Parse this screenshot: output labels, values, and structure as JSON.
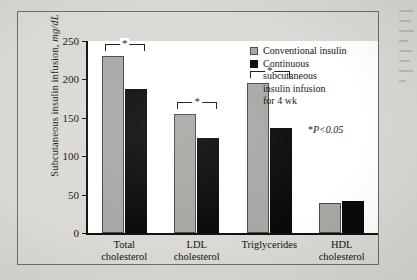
{
  "figure": {
    "y_axis_title_main": "Subcutaneous insulin infusion,",
    "y_axis_title_unit": "mg/dL",
    "significance_note_star": "*",
    "significance_note_text": "P<0.05",
    "bracket_marker": "*"
  },
  "legend": {
    "items": [
      {
        "swatch": "gray",
        "lines": [
          "Conventional insulin"
        ]
      },
      {
        "swatch": "black",
        "lines": [
          "Continuous",
          "subcutaneous",
          "insulin infusion",
          "for 4 wk"
        ]
      }
    ]
  },
  "chart_data": {
    "type": "bar",
    "title": "",
    "xlabel": "",
    "ylabel": "Subcutaneous insulin infusion, mg/dL",
    "ylim": [
      0,
      250
    ],
    "yticks": [
      0,
      50,
      100,
      150,
      200,
      250
    ],
    "ytick_labels": [
      "0",
      "50",
      "100",
      "150",
      "200",
      "250"
    ],
    "grid": false,
    "legend_position": "top-right",
    "categories": [
      "Total cholesterol",
      "LDL cholesterol",
      "Triglycerides",
      "HDL cholesterol"
    ],
    "category_lines": [
      [
        "Total",
        "cholesterol"
      ],
      [
        "LDL",
        "cholesterol"
      ],
      [
        "Triglycerides"
      ],
      [
        "HDL",
        "cholesterol"
      ]
    ],
    "series": [
      {
        "name": "Conventional insulin",
        "color": "#a9a7a4",
        "values": [
          230,
          155,
          195,
          39
        ]
      },
      {
        "name": "Continuous subcutaneous insulin infusion for 4 wk",
        "color": "#0a0a0a",
        "values": [
          188,
          124,
          137,
          42
        ]
      }
    ],
    "significance": [
      true,
      true,
      true,
      false
    ],
    "annotations": [
      "*P<0.05"
    ]
  }
}
